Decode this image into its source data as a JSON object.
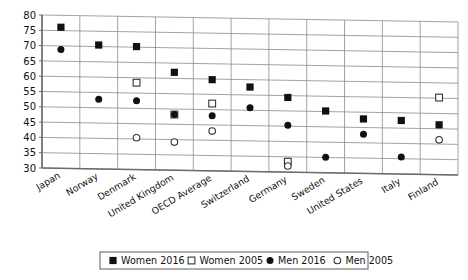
{
  "chart_data": {
    "type": "scatter",
    "title": "",
    "subtitle": "",
    "xlabel": "",
    "ylabel": "",
    "ylim": [
      30,
      80
    ],
    "ytick_step": 5,
    "yticks": [
      30,
      35,
      40,
      45,
      50,
      55,
      60,
      65,
      70,
      75,
      80
    ],
    "grid": true,
    "legend_position": "bottom",
    "categories": [
      "Japan",
      "Norway",
      "Denmark",
      "United Kingdom",
      "OECD Average",
      "Switzerland",
      "Germany",
      "Sweden",
      "United States",
      "Italy",
      "Finland"
    ],
    "series": [
      {
        "name": "Women 2016",
        "marker": "filled-square",
        "values": [
          76.1,
          70.5,
          70.2,
          62.0,
          59.8,
          57.6,
          54.4,
          50.2,
          47.8,
          47.5,
          46.3
        ]
      },
      {
        "name": "Women 2005",
        "marker": "open-square",
        "values": [
          null,
          null,
          58.4,
          48.2,
          52.0,
          null,
          33.4,
          null,
          null,
          null,
          55.2
        ]
      },
      {
        "name": "Men 2016",
        "marker": "filled-circle",
        "values": [
          68.8,
          52.8,
          52.5,
          48.2,
          48.0,
          50.8,
          45.3,
          35.1,
          42.8,
          35.6,
          null
        ]
      },
      {
        "name": "Men 2005",
        "marker": "open-circle",
        "values": [
          null,
          null,
          40.4,
          39.2,
          43.0,
          null,
          32.0,
          null,
          null,
          null,
          41.4
        ]
      }
    ]
  },
  "legend": {
    "entries": [
      {
        "label": "Women 2016",
        "marker": "filled-square"
      },
      {
        "label": "Women 2005",
        "marker": "open-square"
      },
      {
        "label": "Men 2016",
        "marker": "filled-circle"
      },
      {
        "label": "Men 2005",
        "marker": "open-circle"
      }
    ]
  },
  "colors": {
    "marker_fill": "#111111",
    "marker_open_fill": "#ffffff",
    "marker_stroke": "#333333",
    "gridline": "#8c8c8c",
    "axis": "#6b6b6b",
    "background": "#ffffff",
    "text": "#111111"
  }
}
